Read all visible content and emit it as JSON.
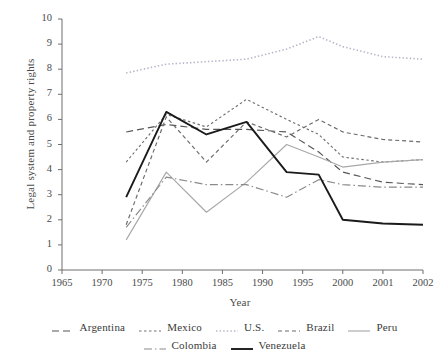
{
  "chart_data": {
    "type": "line",
    "title": "",
    "xlabel": "Year",
    "ylabel": "Legal system and property rights",
    "xlim": [
      1965,
      2002
    ],
    "ylim": [
      0,
      10
    ],
    "grid": false,
    "legend_position": "bottom",
    "xticks": [
      "1965",
      "1970",
      "1975",
      "1980",
      "1985",
      "1990",
      "1995",
      "2000",
      "2001",
      "2002"
    ],
    "yticks": [
      "0",
      "1",
      "2",
      "3",
      "4",
      "5",
      "6",
      "7",
      "8",
      "9",
      "10"
    ],
    "x": [
      1973,
      1978,
      1983,
      1988,
      1993,
      1997,
      2000,
      2001,
      2002
    ],
    "series": [
      {
        "name": "Argentina",
        "style": "dashed",
        "color": "#555555",
        "values": [
          5.5,
          5.8,
          5.6,
          5.6,
          5.5,
          4.7,
          3.9,
          3.5,
          3.4
        ]
      },
      {
        "name": "Mexico",
        "style": "dotted",
        "color": "#707070",
        "values": [
          4.3,
          6.2,
          5.7,
          6.8,
          6.0,
          5.4,
          4.5,
          4.3,
          4.4
        ]
      },
      {
        "name": "U.S.",
        "style": "fine-dotted",
        "color": "#b5b5c8",
        "values": [
          7.85,
          8.2,
          8.3,
          8.4,
          8.8,
          9.3,
          8.9,
          8.5,
          8.4
        ]
      },
      {
        "name": "Brazil",
        "style": "dashed-short",
        "color": "#6a6a6a",
        "values": [
          1.8,
          6.1,
          4.3,
          5.9,
          5.3,
          6.0,
          5.5,
          5.2,
          5.1
        ]
      },
      {
        "name": "Peru",
        "style": "solid-light",
        "color": "#a8a8a8",
        "values": [
          1.2,
          3.9,
          2.3,
          3.5,
          5.0,
          4.5,
          4.1,
          4.3,
          4.4
        ]
      },
      {
        "name": "Colombia",
        "style": "dash-dot",
        "color": "#8a8a8a",
        "values": [
          1.7,
          3.7,
          3.4,
          3.4,
          2.9,
          3.6,
          3.4,
          3.3,
          3.3
        ]
      },
      {
        "name": "Venezuela",
        "style": "solid-dark",
        "color": "#1a1a1a",
        "values": [
          2.9,
          6.3,
          5.4,
          5.9,
          3.9,
          3.8,
          2.0,
          1.85,
          1.8
        ]
      }
    ]
  },
  "axes": {
    "ylabel": "Legal system and property rights",
    "xlabel": "Year"
  },
  "legend": {
    "row1": [
      {
        "label": "Argentina",
        "swatch": "legend-swatch-argentina"
      },
      {
        "label": "Mexico",
        "swatch": "legend-swatch-mexico"
      },
      {
        "label": "U.S.",
        "swatch": "legend-swatch-us"
      },
      {
        "label": "Brazil",
        "swatch": "legend-swatch-brazil"
      },
      {
        "label": "Peru",
        "swatch": "legend-swatch-peru"
      }
    ],
    "row2": [
      {
        "label": "Colombia",
        "swatch": "legend-swatch-colombia"
      },
      {
        "label": "Venezuela",
        "swatch": "legend-swatch-venezuela"
      }
    ]
  }
}
